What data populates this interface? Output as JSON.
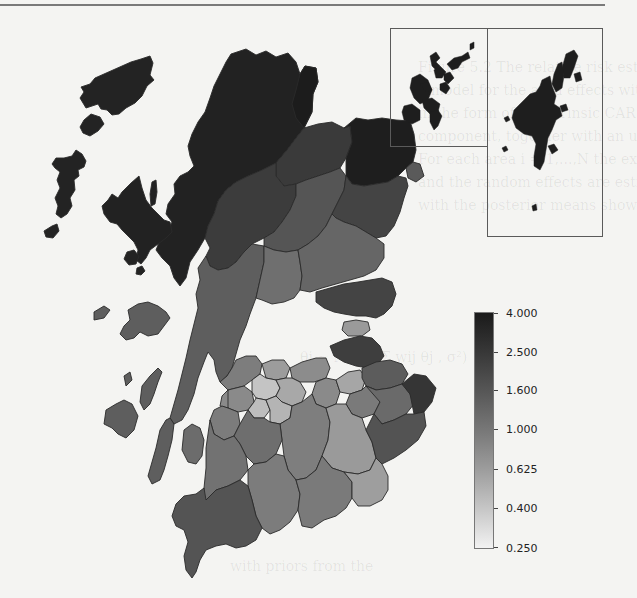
{
  "figure": {
    "type": "choropleth-map",
    "insets": [
      {
        "name": "Orkney"
      },
      {
        "name": "Shetland"
      }
    ]
  },
  "legend": {
    "labels": [
      "4.000",
      "2.500",
      "1.600",
      "1.000",
      "0.625",
      "0.400",
      "0.250"
    ],
    "color_top": "#1a1a1a",
    "color_bottom": "#f2f2f2",
    "scale": "log"
  },
  "colors": {
    "darkest": "#1e1e1e",
    "very_dark": "#2e2e2e",
    "dark": "#3f3f3f",
    "mid_dark": "#555555",
    "mid": "#6c6c6c",
    "mid_light": "#858585",
    "light": "#a5a5a5",
    "very_light": "#c8c8c8",
    "outline": "#2a2a2a",
    "rule": "#7a7a7a",
    "background": "#f4f4f2"
  },
  "ghost_text": {
    "line1": "Figure 5.2  The relative risk estimates. We now use",
    "line2": "a model for the area effects with a spatial structure",
    "line3": "in the form of an intrinsic CAR (Besag et al. 1991)",
    "line4": "component, together with an unstructured term.",
    "line5": "For each area i = 1,...,N the expected counts E",
    "line6": "and the random effects are estimated jointly,",
    "line7": "with the posterior means shown in the map.",
    "low1": "θi ~ N(μ + Σ wij θj , σ²)",
    "low2": "",
    "lower1": "with priors from the"
  }
}
